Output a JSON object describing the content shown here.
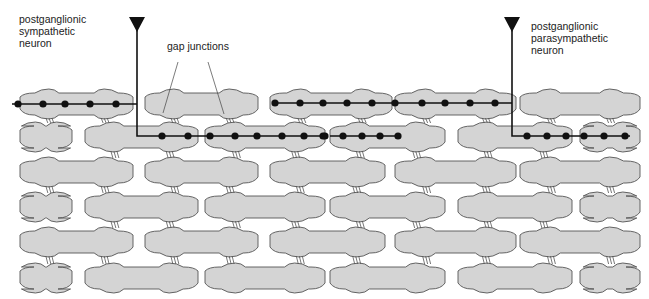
{
  "labels": {
    "sympathetic": "postganglionic\nsympathetic\nneuron",
    "parasympathetic": "postganglionic\nparasympathetic\nneuron",
    "gap_junctions": "gap junctions"
  },
  "colors": {
    "cell_fill": "#d4d4d4",
    "cell_stroke": "#555555",
    "axon": "#111111"
  },
  "rows": [
    {
      "y": 104,
      "cells": [
        [
          20,
          133
        ],
        [
          145,
          258
        ],
        [
          270,
          392
        ],
        [
          395,
          516
        ],
        [
          520,
          640
        ]
      ]
    },
    {
      "y": 137,
      "cells": [
        [
          20,
          72
        ],
        [
          85,
          198
        ],
        [
          205,
          325
        ],
        [
          330,
          445
        ],
        [
          458,
          572
        ],
        [
          580,
          640
        ]
      ]
    },
    {
      "y": 172,
      "cells": [
        [
          20,
          133
        ],
        [
          145,
          258
        ],
        [
          270,
          385
        ],
        [
          395,
          516
        ],
        [
          520,
          640
        ]
      ]
    },
    {
      "y": 207,
      "cells": [
        [
          20,
          72
        ],
        [
          85,
          198
        ],
        [
          205,
          325
        ],
        [
          330,
          445
        ],
        [
          458,
          572
        ],
        [
          580,
          640
        ]
      ]
    },
    {
      "y": 242,
      "cells": [
        [
          20,
          133
        ],
        [
          145,
          258
        ],
        [
          270,
          385
        ],
        [
          395,
          516
        ],
        [
          520,
          640
        ]
      ]
    },
    {
      "y": 278,
      "cells": [
        [
          20,
          72
        ],
        [
          85,
          198
        ],
        [
          205,
          325
        ],
        [
          330,
          445
        ],
        [
          458,
          572
        ],
        [
          580,
          640
        ]
      ]
    }
  ],
  "neurons": [
    {
      "name": "sympathetic",
      "terminal": [
        137,
        22
      ],
      "path": [
        [
          12,
          104
        ],
        [
          137,
          104
        ],
        [
          137,
          22
        ],
        [
          137,
          136
        ],
        [
          325,
          136
        ]
      ],
      "varicosities": [
        [
          18,
          104
        ],
        [
          43,
          104
        ],
        [
          65,
          104
        ],
        [
          90,
          104
        ],
        [
          116,
          104
        ],
        [
          162,
          136
        ],
        [
          188,
          136
        ],
        [
          210,
          136
        ],
        [
          235,
          136
        ],
        [
          257,
          136
        ],
        [
          282,
          136
        ],
        [
          304,
          136
        ],
        [
          325,
          136
        ]
      ]
    },
    {
      "name": "sympathetic-branch",
      "terminal": null,
      "path": [
        [
          330,
          136
        ],
        [
          398,
          136
        ]
      ],
      "varicosities": [
        [
          323,
          136
        ],
        [
          343,
          136
        ],
        [
          362,
          136
        ],
        [
          380,
          136
        ],
        [
          398,
          136
        ]
      ]
    },
    {
      "name": "parasympathetic",
      "terminal": [
        512,
        22
      ],
      "path": [
        [
          275,
          103
        ],
        [
          512,
          103
        ],
        [
          512,
          22
        ],
        [
          512,
          136
        ],
        [
          630,
          136
        ]
      ],
      "varicosities": [
        [
          275,
          103
        ],
        [
          300,
          103
        ],
        [
          323,
          103
        ],
        [
          347,
          103
        ],
        [
          372,
          103
        ],
        [
          395,
          103
        ],
        [
          422,
          103
        ],
        [
          445,
          103
        ],
        [
          470,
          103
        ],
        [
          495,
          103
        ],
        [
          527,
          136
        ],
        [
          547,
          136
        ],
        [
          566,
          136
        ],
        [
          584,
          136
        ],
        [
          604,
          136
        ],
        [
          625,
          136
        ]
      ]
    }
  ],
  "gap_junction_leaders": [
    [
      178,
      62,
      163,
      113
    ],
    [
      208,
      62,
      224,
      114
    ]
  ]
}
